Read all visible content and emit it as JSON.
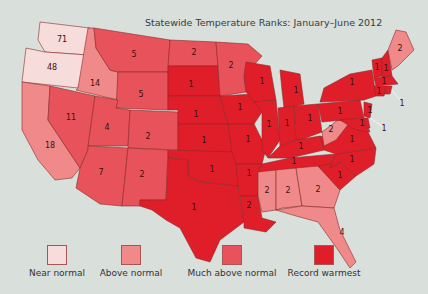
{
  "title": "Statewide Temperature Ranks: January–June 2012",
  "colors": {
    "near_normal": "#f7dcdc",
    "above_normal": "#f08a8a",
    "much_above_normal": "#e8525a",
    "record_warmest": "#e01e2a",
    "background": "#d9dfdb"
  },
  "legend": [
    {
      "label": "Near normal",
      "color": "#f7dcdc"
    },
    {
      "label": "Above normal",
      "color": "#f08a8a"
    },
    {
      "label": "Much above normal",
      "color": "#e8525a"
    },
    {
      "label": "Record warmest",
      "color": "#e01e2a"
    }
  ],
  "states": [
    {
      "state": "WA",
      "rank": "71"
    },
    {
      "state": "OR",
      "rank": "48"
    },
    {
      "state": "ID",
      "rank": "14"
    },
    {
      "state": "MT",
      "rank": "5"
    },
    {
      "state": "WY",
      "rank": "5"
    },
    {
      "state": "NV",
      "rank": "11"
    },
    {
      "state": "CA",
      "rank": "18"
    },
    {
      "state": "UT",
      "rank": "4"
    },
    {
      "state": "CO",
      "rank": "2"
    },
    {
      "state": "AZ",
      "rank": "7"
    },
    {
      "state": "NM",
      "rank": "2"
    },
    {
      "state": "ND",
      "rank": "2"
    },
    {
      "state": "SD",
      "rank": "1"
    },
    {
      "state": "NE",
      "rank": "1"
    },
    {
      "state": "KS",
      "rank": "1"
    },
    {
      "state": "OK",
      "rank": "1"
    },
    {
      "state": "TX",
      "rank": "1"
    },
    {
      "state": "MN",
      "rank": "2"
    },
    {
      "state": "IA",
      "rank": "1"
    },
    {
      "state": "MO",
      "rank": "1"
    },
    {
      "state": "AR",
      "rank": "1"
    },
    {
      "state": "LA",
      "rank": "2"
    },
    {
      "state": "WI",
      "rank": "1"
    },
    {
      "state": "IL",
      "rank": "1"
    },
    {
      "state": "MI",
      "rank": "1"
    },
    {
      "state": "IN",
      "rank": "1"
    },
    {
      "state": "OH",
      "rank": "1"
    },
    {
      "state": "KY",
      "rank": "1"
    },
    {
      "state": "TN",
      "rank": "1"
    },
    {
      "state": "MS",
      "rank": "2"
    },
    {
      "state": "AL",
      "rank": "2"
    },
    {
      "state": "GA",
      "rank": "2"
    },
    {
      "state": "FL",
      "rank": "4"
    },
    {
      "state": "SC",
      "rank": "1"
    },
    {
      "state": "NC",
      "rank": "1"
    },
    {
      "state": "VA",
      "rank": "1"
    },
    {
      "state": "WV",
      "rank": "2"
    },
    {
      "state": "PA",
      "rank": "1"
    },
    {
      "state": "NY",
      "rank": "1"
    },
    {
      "state": "VT",
      "rank": "1"
    },
    {
      "state": "NH",
      "rank": "1"
    },
    {
      "state": "ME",
      "rank": "2"
    },
    {
      "state": "MA",
      "rank": "1"
    },
    {
      "state": "CT",
      "rank": "1"
    },
    {
      "state": "RI",
      "rank": "1"
    },
    {
      "state": "NJ",
      "rank": "1"
    },
    {
      "state": "DE",
      "rank": "1"
    },
    {
      "state": "MD",
      "rank": "1"
    }
  ]
}
